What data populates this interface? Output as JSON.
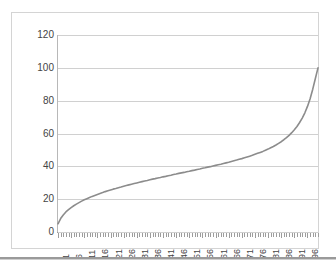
{
  "chart_data": {
    "type": "line",
    "title": "",
    "subtitle": "",
    "xlabel": "",
    "ylabel": "",
    "ylim": [
      0,
      120
    ],
    "y_ticks": [
      0,
      20,
      40,
      60,
      80,
      100,
      120
    ],
    "grid": true,
    "legend": false,
    "legend_position": "none",
    "series_color": "#8c8c8c",
    "gridline_color": "#d0d0d0",
    "axis_color": "#9d9d9d",
    "label_color": "#444444",
    "x_tick_labels": [
      1,
      6,
      11,
      16,
      21,
      26,
      31,
      36,
      41,
      46,
      51,
      56,
      61,
      66,
      71,
      76,
      81,
      86,
      91,
      96
    ],
    "x_tick_label_rotation": -90,
    "categories": [
      1,
      2,
      3,
      4,
      5,
      6,
      7,
      8,
      9,
      10,
      11,
      12,
      13,
      14,
      15,
      16,
      17,
      18,
      19,
      20,
      21,
      22,
      23,
      24,
      25,
      26,
      27,
      28,
      29,
      30,
      31,
      32,
      33,
      34,
      35,
      36,
      37,
      38,
      39,
      40,
      41,
      42,
      43,
      44,
      45,
      46,
      47,
      48,
      49,
      50,
      51,
      52,
      53,
      54,
      55,
      56,
      57,
      58,
      59,
      60,
      61,
      62,
      63,
      64,
      65,
      66,
      67,
      68,
      69,
      70,
      71,
      72,
      73,
      74,
      75,
      76,
      77,
      78,
      79,
      80,
      81,
      82,
      83,
      84,
      85,
      86,
      87,
      88,
      89,
      90,
      91,
      92,
      93,
      94,
      95,
      96,
      97,
      98,
      99,
      100
    ],
    "values": [
      5.0,
      8.2,
      10.4,
      12.2,
      13.6,
      14.9,
      16.0,
      17.0,
      17.9,
      18.8,
      19.6,
      20.3,
      21.0,
      21.7,
      22.3,
      22.9,
      23.5,
      24.0,
      24.6,
      25.1,
      25.6,
      26.1,
      26.5,
      27.0,
      27.4,
      27.9,
      28.3,
      28.7,
      29.1,
      29.5,
      29.9,
      30.3,
      30.7,
      31.1,
      31.4,
      31.8,
      32.2,
      32.5,
      32.9,
      33.2,
      33.6,
      33.9,
      34.3,
      34.6,
      35.0,
      35.3,
      35.7,
      36.0,
      36.3,
      36.7,
      37.0,
      37.4,
      37.7,
      38.1,
      38.4,
      38.8,
      39.1,
      39.5,
      39.8,
      40.2,
      40.6,
      41.0,
      41.3,
      41.7,
      42.1,
      42.5,
      43.0,
      43.4,
      43.8,
      44.3,
      44.7,
      45.2,
      45.7,
      46.2,
      46.7,
      47.3,
      47.9,
      48.5,
      49.1,
      49.8,
      50.5,
      51.3,
      52.1,
      53.0,
      54.0,
      55.0,
      56.2,
      57.5,
      58.9,
      60.5,
      62.3,
      64.3,
      66.7,
      69.4,
      72.6,
      76.5,
      81.2,
      87.0,
      93.5,
      100.0
    ],
    "axis_ranges": {
      "x": [
        1,
        100
      ],
      "y": [
        0,
        120
      ]
    }
  },
  "figure": {
    "border_color": "#d4d4d4",
    "background": "#ffffff",
    "page_rule_color": "#9a9a9a"
  }
}
